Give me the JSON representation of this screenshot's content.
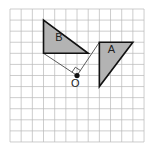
{
  "grid": {
    "columns": 12,
    "rows": 12,
    "origin_px": [
      10,
      9
    ],
    "cell_px": [
      11.17,
      11.08
    ],
    "line_color": "#b8b8b8",
    "background": "#ffffff"
  },
  "shapes": [
    {
      "id": "triangle-b",
      "label": "B",
      "vertices_grid": [
        [
          3,
          1
        ],
        [
          3,
          4
        ],
        [
          7,
          4
        ]
      ],
      "label_grid": [
        4.05,
        2.9
      ],
      "fill": "#b3b3b3",
      "stroke": "#111111"
    },
    {
      "id": "triangle-a",
      "label": "A",
      "vertices_grid": [
        [
          8,
          3
        ],
        [
          11,
          3
        ],
        [
          8,
          7
        ]
      ],
      "label_grid": [
        8.75,
        4.0
      ],
      "fill": "#b3b3b3",
      "stroke": "#111111"
    }
  ],
  "center": {
    "label": "O",
    "point_grid": [
      6,
      6
    ],
    "label_grid": [
      5.45,
      7.0
    ]
  },
  "construction_lines": [
    {
      "from_grid": [
        3,
        4
      ],
      "to_grid": [
        6,
        6
      ]
    },
    {
      "from_grid": [
        6,
        6
      ],
      "to_grid": [
        8,
        3
      ]
    }
  ],
  "right_angle_marker": {
    "at_grid": [
      6,
      6
    ],
    "size_px": 6
  },
  "labels": {
    "triangle_a": "A",
    "triangle_b": "B",
    "center_o": "O"
  }
}
